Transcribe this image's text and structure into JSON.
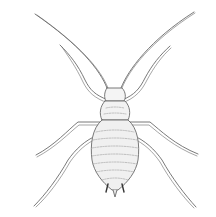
{
  "image": {
    "subject": "aphid",
    "description": "Black-and-white stippled line illustration of an aphid viewed from above, with long antennae and six legs",
    "background": "#ffffff",
    "ink": "#6a6a6a"
  }
}
